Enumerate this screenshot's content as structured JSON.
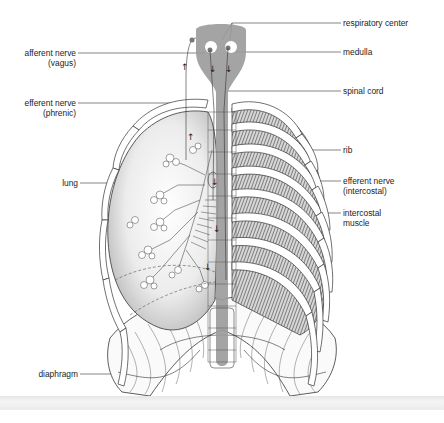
{
  "figure": {
    "colors": {
      "spinal_cord": "#9a9a9a",
      "line": "#2a2a2a",
      "background": "#ffffff"
    }
  },
  "labels": {
    "left": [
      {
        "id": "afferent-vagus",
        "line1": "afferent nerve",
        "line2": "(vagus)"
      },
      {
        "id": "efferent-phrenic",
        "line1": "efferent nerve",
        "line2": "(phrenic)"
      },
      {
        "id": "lung",
        "line1": "lung",
        "line2": ""
      },
      {
        "id": "diaphragm",
        "line1": "diaphragm",
        "line2": ""
      }
    ],
    "right": [
      {
        "id": "respiratory-center",
        "line1": "respiratory center",
        "line2": ""
      },
      {
        "id": "medulla",
        "line1": "medulla",
        "line2": ""
      },
      {
        "id": "spinal-cord",
        "line1": "spinal cord",
        "line2": ""
      },
      {
        "id": "rib",
        "line1": "rib",
        "line2": ""
      },
      {
        "id": "efferent-intercostal",
        "line1": "efferent nerve",
        "line2": "(intercostal)"
      },
      {
        "id": "intercostal-muscle",
        "line1": "intercostal",
        "line2": "muscle"
      }
    ]
  }
}
